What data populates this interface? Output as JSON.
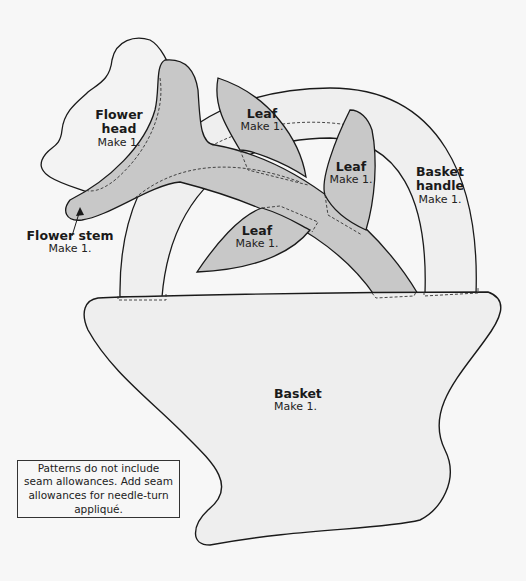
{
  "pieces": [
    {
      "id": "flower-head",
      "title": "Flower head",
      "title_lines": [
        "Flower",
        "head"
      ],
      "make": "Make 1."
    },
    {
      "id": "flower-stem",
      "title": "Flower stem",
      "make": "Make 1."
    },
    {
      "id": "leaf-top",
      "title": "Leaf",
      "make": "Make 1."
    },
    {
      "id": "leaf-right",
      "title": "Leaf",
      "make": "Make 1."
    },
    {
      "id": "leaf-lower",
      "title": "Leaf",
      "make": "Make 1."
    },
    {
      "id": "basket-handle",
      "title": "Basket handle",
      "title_lines": [
        "Basket",
        "handle"
      ],
      "make": "Make 1."
    },
    {
      "id": "basket",
      "title": "Basket",
      "make": "Make 1."
    }
  ],
  "note": "Patterns do not include seam allowances. Add seam allowances for needle-turn appliqué.",
  "colors": {
    "background": "#f7f7f7",
    "shaded_fill": "#c8c8c8",
    "light_fill": "#eeeeee",
    "outline": "#1a1a1a"
  }
}
